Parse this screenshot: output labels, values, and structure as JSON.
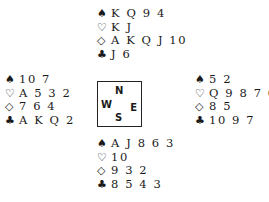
{
  "hands": {
    "north": {
      "spades": "K Q 9 4",
      "hearts": "K J",
      "diamonds": "A K Q J 10",
      "clubs": "J 6"
    },
    "west": {
      "spades": "10 7",
      "hearts": "A 5 3 2",
      "diamonds": "7 6 4",
      "clubs": "A K Q 2"
    },
    "east": {
      "spades": "5 2",
      "hearts": "Q 9 8 7 6 4",
      "diamonds": "8 5",
      "clubs": "10 9 7"
    },
    "south": {
      "spades": "A J 8 6 3",
      "hearts": "10",
      "diamonds": "9 3 2",
      "clubs": "8 5 4 3"
    }
  },
  "symbols": {
    "spades": "♠",
    "hearts": "♡",
    "diamonds": "◇",
    "clubs": "♣"
  },
  "compass": {
    "n": "N",
    "w": "W",
    "e": "E",
    "s": "S"
  }
}
